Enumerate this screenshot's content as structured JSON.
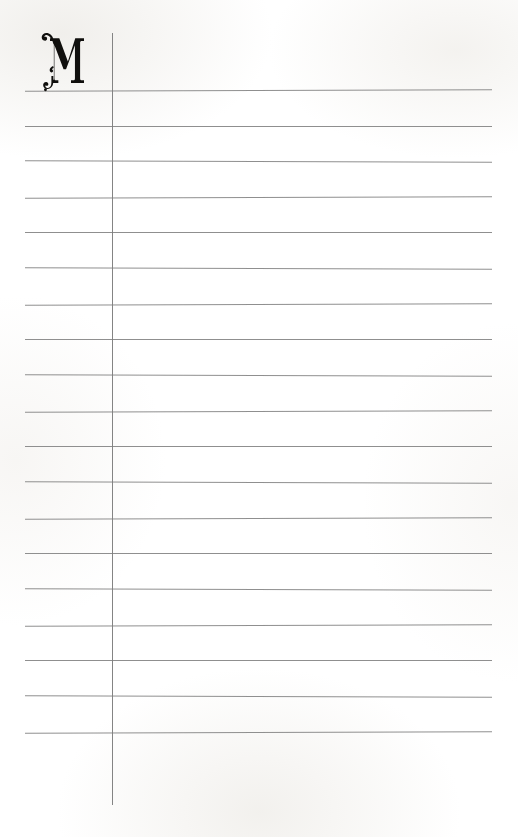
{
  "page": {
    "kind": "ruled-notebook-page",
    "width": 518,
    "height": 837,
    "background_color": "#ffffff",
    "paper_tint": "#fefefe"
  },
  "drop_cap": {
    "letter": "M",
    "style": "ornamental-victorian-serif-swash-capital",
    "color": "#100f0d",
    "x": 38,
    "y": 30,
    "width": 48,
    "height": 61,
    "description": "Decorative capital M with a curled swash descending below the baseline on the left stem"
  },
  "margin_rule": {
    "name": "vertical-margin-rule",
    "color": "#7d7d7d",
    "x": 112,
    "y_top": 33,
    "y_bottom": 805,
    "thickness": 1
  },
  "ruled_lines": {
    "name": "horizontal-writing-lines",
    "color": "#868686",
    "thickness": 1,
    "x_start": 25,
    "x_end": 492,
    "spacing": 35.7,
    "count": 19,
    "y_positions": [
      90,
      126,
      161,
      197,
      232,
      268,
      304,
      339,
      375,
      411,
      446,
      482,
      518,
      553,
      589,
      625,
      660,
      696,
      732
    ]
  }
}
